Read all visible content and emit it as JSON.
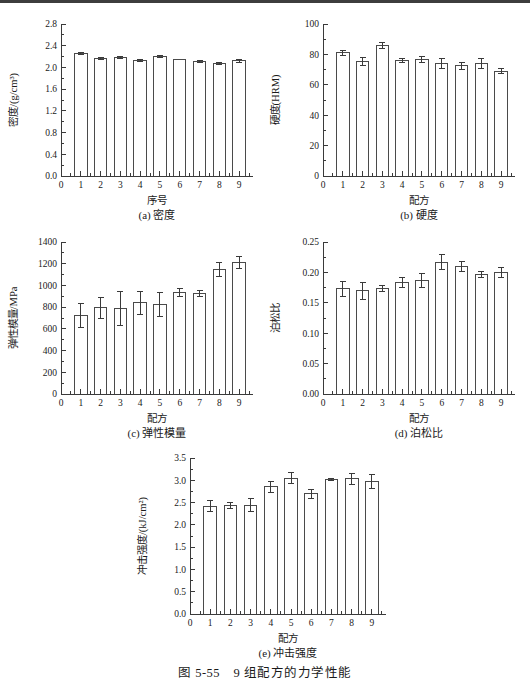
{
  "page": {
    "figure_caption": "图 5-55　9 组配方的力学性能"
  },
  "chart_data": [
    {
      "id": "a",
      "type": "bar",
      "subcaption": "(a) 密度",
      "xlabel": "序号",
      "ylabel": "密度/(g/cm³)",
      "categories": [
        "1",
        "2",
        "3",
        "4",
        "5",
        "6",
        "7",
        "8",
        "9"
      ],
      "values": [
        2.25,
        2.17,
        2.18,
        2.13,
        2.2,
        2.15,
        2.11,
        2.08,
        2.12
      ],
      "errors": [
        0.02,
        0.02,
        0.02,
        0.02,
        0.02,
        0,
        0.02,
        0.02,
        0.02
      ],
      "ylim": [
        0,
        2.8
      ],
      "ytick_step": 0.4,
      "ytick_decimals": 1,
      "xlim": [
        0,
        9.7
      ],
      "grid": false,
      "legend": "none"
    },
    {
      "id": "b",
      "type": "bar",
      "subcaption": "(b) 硬度",
      "xlabel": "配方",
      "ylabel": "硬度(HRM)",
      "categories": [
        "1",
        "2",
        "3",
        "4",
        "5",
        "6",
        "7",
        "8",
        "9"
      ],
      "values": [
        81,
        75.5,
        86,
        76,
        76.5,
        74,
        72.5,
        74,
        69
      ],
      "errors": [
        1.5,
        2.5,
        2,
        1.5,
        2,
        3,
        2.5,
        3,
        1.5
      ],
      "ylim": [
        0,
        100
      ],
      "ytick_step": 20,
      "ytick_decimals": 0,
      "xlim": [
        0,
        9.7
      ],
      "grid": false,
      "legend": "none"
    },
    {
      "id": "c",
      "type": "bar",
      "subcaption": "(c) 弹性模量",
      "xlabel": "配方",
      "ylabel": "弹性模量/MPa",
      "categories": [
        "1",
        "2",
        "3",
        "4",
        "5",
        "6",
        "7",
        "8",
        "9"
      ],
      "values": [
        725,
        795,
        785,
        840,
        825,
        935,
        925,
        1145,
        1215
      ],
      "errors": [
        110,
        95,
        155,
        105,
        110,
        40,
        25,
        65,
        55
      ],
      "ylim": [
        0,
        1400
      ],
      "ytick_step": 200,
      "ytick_decimals": 0,
      "xlim": [
        0,
        9.7
      ],
      "grid": false,
      "legend": "none"
    },
    {
      "id": "d",
      "type": "bar",
      "subcaption": "(d) 泊松比",
      "xlabel": "配方",
      "ylabel": "泊松比",
      "categories": [
        "1",
        "2",
        "3",
        "4",
        "5",
        "6",
        "7",
        "8",
        "9"
      ],
      "values": [
        0.173,
        0.17,
        0.173,
        0.183,
        0.187,
        0.217,
        0.21,
        0.197,
        0.2
      ],
      "errors": [
        0.012,
        0.014,
        0.005,
        0.008,
        0.012,
        0.012,
        0.008,
        0.005,
        0.008
      ],
      "ylim": [
        0,
        0.25
      ],
      "ytick_step": 0.05,
      "ytick_decimals": 2,
      "xlim": [
        0,
        9.7
      ],
      "grid": false,
      "legend": "none"
    },
    {
      "id": "e",
      "type": "bar",
      "subcaption": "(e) 冲击强度",
      "xlabel": "配方",
      "ylabel": "冲击强度/(kJ/cm²)",
      "categories": [
        "1",
        "2",
        "3",
        "4",
        "5",
        "6",
        "7",
        "8",
        "9"
      ],
      "values": [
        2.42,
        2.43,
        2.44,
        2.85,
        3.05,
        2.7,
        3.02,
        3.03,
        2.97
      ],
      "errors": [
        0.12,
        0.07,
        0.15,
        0.12,
        0.13,
        0.1,
        0.02,
        0.13,
        0.15
      ],
      "ylim": [
        0,
        3.5
      ],
      "ytick_step": 0.5,
      "ytick_decimals": 1,
      "xlim": [
        0,
        9.7
      ],
      "grid": false,
      "legend": "none"
    }
  ]
}
